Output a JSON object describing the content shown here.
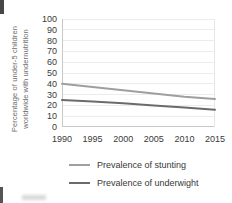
{
  "chart_data": {
    "type": "line",
    "x": [
      1990,
      1995,
      2000,
      2005,
      2010,
      2015
    ],
    "series": [
      {
        "name": "Prevalence of stunting",
        "color": "#9f9f9f",
        "values": [
          40,
          37,
          34,
          31,
          28,
          26
        ]
      },
      {
        "name": "Prevalence of underwight",
        "color": "#6b6b6b",
        "values": [
          25,
          23.5,
          22,
          20,
          18,
          16
        ]
      }
    ],
    "title": "",
    "xlabel": "",
    "ylabel_lines": [
      "Percentage of under-5 children",
      "worldwide with undernutrition"
    ],
    "ylim": [
      0,
      100
    ],
    "ytick_step": 10,
    "grid": "horizontal",
    "legend_position": "bottom"
  },
  "colors": {
    "background": "#ffffff",
    "grid": "#ececec",
    "axis": "#c9c9c9",
    "plot_right_border": "#e7e7e7",
    "tick_text": "#3a3a3a",
    "axis_title_text": "#6e6e6e",
    "legend_text": "#383838"
  }
}
